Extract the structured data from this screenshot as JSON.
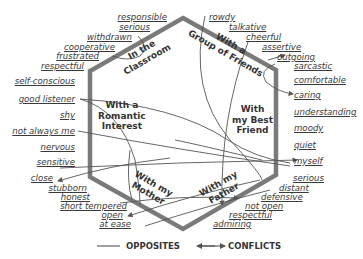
{
  "diagram": {
    "contexts": [
      {
        "id": "classroom",
        "label_lines": [
          "In the",
          "Classroom"
        ]
      },
      {
        "id": "group",
        "label_lines": [
          "With a",
          "Group of Friends"
        ]
      },
      {
        "id": "best",
        "label_lines": [
          "With",
          "my Best",
          "Friend"
        ]
      },
      {
        "id": "father",
        "label_lines": [
          "With my",
          "Father"
        ]
      },
      {
        "id": "mother",
        "label_lines": [
          "With my",
          "Mother"
        ]
      },
      {
        "id": "romantic",
        "label_lines": [
          "With a",
          "Romantic",
          "Interest"
        ]
      }
    ],
    "left_words": [
      "responsible",
      "serious",
      "withdrawn",
      "cooperative",
      "frustrated",
      "respectful",
      "self-conscious",
      "good listener",
      "shy",
      "not always me",
      "nervous",
      "sensitive",
      "close",
      "stubborn",
      "honest",
      "short tempered",
      "open",
      "at ease"
    ],
    "right_words": [
      "rowdy",
      "talkative",
      "cheerful",
      "assertive",
      "outgoing",
      "sarcastic",
      "comfortable",
      "caring",
      "understanding",
      "moody",
      "quiet",
      "myself",
      "serious",
      "distant",
      "defensive",
      "not open",
      "respectful",
      "admiring"
    ],
    "legend": {
      "opposites_label": "OPPOSITES",
      "conflicts_label": "CONFLICTS"
    },
    "colors": {
      "hexagon": "#7a7a7a",
      "lines": "#555555",
      "text": "#3a3a3a"
    }
  }
}
